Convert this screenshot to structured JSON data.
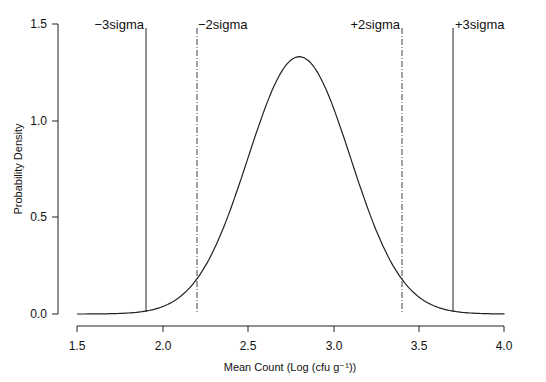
{
  "chart_data": {
    "type": "line",
    "title": "",
    "xlabel": "Mean Count (Log (cfu g⁻¹))",
    "ylabel": "Probability Density",
    "xlim": [
      1.5,
      4.0
    ],
    "ylim": [
      0.0,
      1.5
    ],
    "x_ticks": [
      "1.5",
      "2.0",
      "2.5",
      "3.0",
      "3.5",
      "4.0"
    ],
    "y_ticks": [
      "0.0",
      "0.5",
      "1.0",
      "1.5"
    ],
    "grid": false,
    "legend": "none",
    "series": [
      {
        "name": "Normal distribution",
        "distribution": {
          "mean": 2.8,
          "sd": 0.3
        },
        "x": [
          1.5,
          1.6,
          1.7,
          1.8,
          1.9,
          2.0,
          2.1,
          2.2,
          2.3,
          2.4,
          2.5,
          2.6,
          2.7,
          2.8,
          2.9,
          3.0,
          3.1,
          3.2,
          3.3,
          3.4,
          3.5,
          3.6,
          3.7,
          3.8,
          3.9,
          4.0
        ],
        "values": [
          0.0001,
          0.0005,
          0.0016,
          0.0051,
          0.0148,
          0.0377,
          0.0881,
          0.18,
          0.3315,
          0.5467,
          0.8066,
          1.0648,
          1.2579,
          1.3298,
          1.2579,
          1.0648,
          0.8066,
          0.5467,
          0.3315,
          0.18,
          0.0881,
          0.0377,
          0.0148,
          0.0051,
          0.0016,
          0.0005
        ]
      }
    ],
    "annotations": [
      {
        "label": "-3sigma",
        "x": 1.9,
        "style": "solid"
      },
      {
        "label": "-2sigma",
        "x": 2.2,
        "style": "dashdot"
      },
      {
        "label": "+2sigma",
        "x": 3.4,
        "style": "dashdot"
      },
      {
        "label": "+3sigma",
        "x": 3.7,
        "style": "solid"
      }
    ]
  },
  "labels": {
    "minus3": "−3sigma",
    "minus2": "−2sigma",
    "plus2": "+2sigma",
    "plus3": "+3sigma",
    "xlabel": "Mean Count (Log (cfu g⁻¹))",
    "ylabel": "Probability Density",
    "x_ticks": [
      "1.5",
      "2.0",
      "2.5",
      "3.0",
      "3.5",
      "4.0"
    ],
    "y_ticks": [
      "0.0",
      "0.5",
      "1.0",
      "1.5"
    ]
  }
}
